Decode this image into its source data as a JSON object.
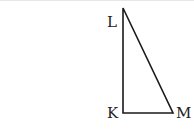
{
  "diagram": {
    "type": "right-triangle",
    "vertices": [
      {
        "name": "L",
        "x": 123,
        "y": 8
      },
      {
        "name": "K",
        "x": 123,
        "y": 113
      },
      {
        "name": "M",
        "x": 173,
        "y": 113
      }
    ],
    "labels": {
      "L": "L",
      "K": "K",
      "M": "M"
    },
    "right_angle_at": "K",
    "stroke_color": "#1a1a1a"
  }
}
